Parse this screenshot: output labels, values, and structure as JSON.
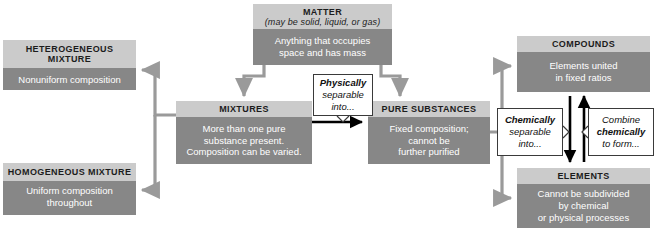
{
  "diagram": {
    "colors": {
      "box_header": "#cbcbcb",
      "box_body": "#878787",
      "connector_gray": "#9a9a9a",
      "connector_black": "#000000",
      "callout_bg": "#ffffff",
      "callout_border": "#3a3a3a",
      "body_text": "#ffffff",
      "header_text": "#1c1c1c"
    },
    "boxes": {
      "matter": {
        "title": "MATTER",
        "subtitle": "(may be solid, liquid, or gas)",
        "body_lines": [
          "Anything that occupies",
          "space and has mass"
        ]
      },
      "heterogeneous": {
        "title": "HETEROGENEOUS MIXTURE",
        "body_lines": [
          "Nonuniform composition"
        ]
      },
      "homogeneous": {
        "title": "HOMOGENEOUS MIXTURE",
        "body_lines": [
          "Uniform composition",
          "throughout"
        ]
      },
      "mixtures": {
        "title": "MIXTURES",
        "body_lines": [
          "More than one pure",
          "substance present.",
          "Composition can be varied."
        ]
      },
      "pure_substances": {
        "title": "PURE SUBSTANCES",
        "body_lines": [
          "Fixed composition;",
          "cannot be",
          "further purified"
        ]
      },
      "compounds": {
        "title": "COMPOUNDS",
        "body_lines": [
          "Elements united",
          "in fixed ratios"
        ]
      },
      "elements": {
        "title": "ELEMENTS",
        "body_lines": [
          "Cannot be subdivided",
          "by chemical",
          "or physical processes"
        ]
      }
    },
    "callouts": {
      "physically": {
        "emphasis": "Physically",
        "line2": "separable",
        "line3": "into..."
      },
      "chemically": {
        "emphasis": "Chemically",
        "line2": "separable",
        "line3": "into..."
      },
      "combine": {
        "line1": "Combine",
        "emphasis": "chemically",
        "line3": "to form..."
      }
    }
  }
}
